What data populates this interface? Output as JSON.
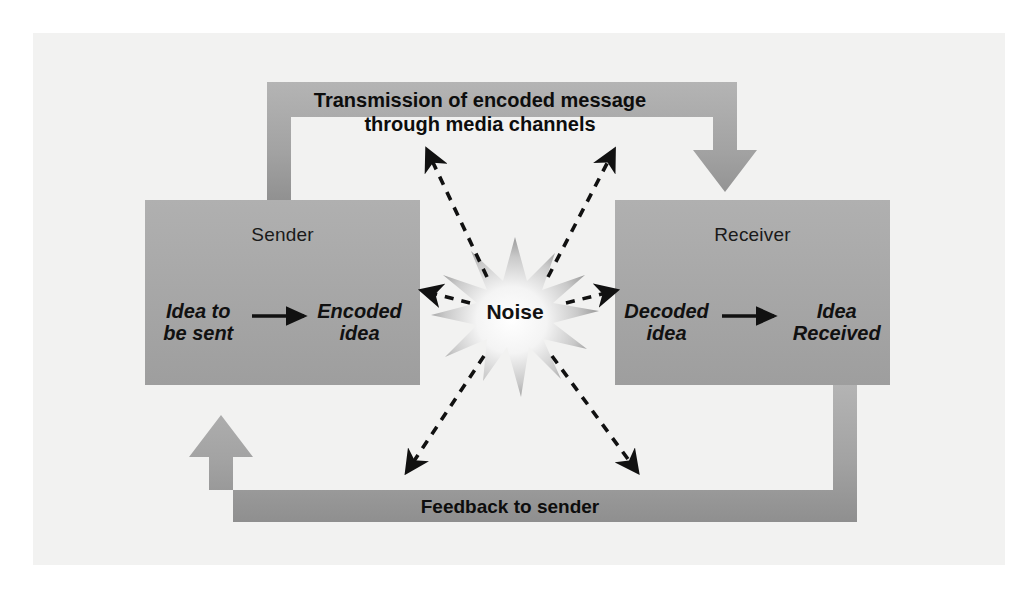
{
  "figure": {
    "background_color": "#ffffff",
    "panel_color": "#f2f2f1",
    "box_fill": "#a8a8a8",
    "band_fill": "#a0a0a0",
    "arrow_fill": "#9a9a9a",
    "text_color": "#111111",
    "dashed_color": "#111111"
  },
  "sender": {
    "title": "Sender",
    "left_term": "Idea to\nbe sent",
    "right_term": "Encoded\nidea",
    "inner_arrow": "right-arrow-icon"
  },
  "receiver": {
    "title": "Receiver",
    "left_term": "Decoded\nidea",
    "right_term": "Idea\nReceived",
    "inner_arrow": "right-arrow-icon"
  },
  "transmission": {
    "label": "Transmission of encoded message\nthrough media channels",
    "direction": "sender-to-receiver",
    "arrowhead": "down-arrow-icon"
  },
  "feedback": {
    "label": "Feedback to sender",
    "direction": "receiver-to-sender",
    "arrowhead": "up-arrow-icon"
  },
  "noise": {
    "label": "Noise",
    "shape": "starburst",
    "points": 14,
    "arrows": [
      {
        "name": "noise-arrow-up-left",
        "target": "transmission-band-left"
      },
      {
        "name": "noise-arrow-up-right",
        "target": "transmission-band-right"
      },
      {
        "name": "noise-arrow-left",
        "target": "sender-box"
      },
      {
        "name": "noise-arrow-right",
        "target": "receiver-box"
      },
      {
        "name": "noise-arrow-down-left",
        "target": "feedback-band-left"
      },
      {
        "name": "noise-arrow-down-right",
        "target": "feedback-band-right"
      }
    ]
  }
}
